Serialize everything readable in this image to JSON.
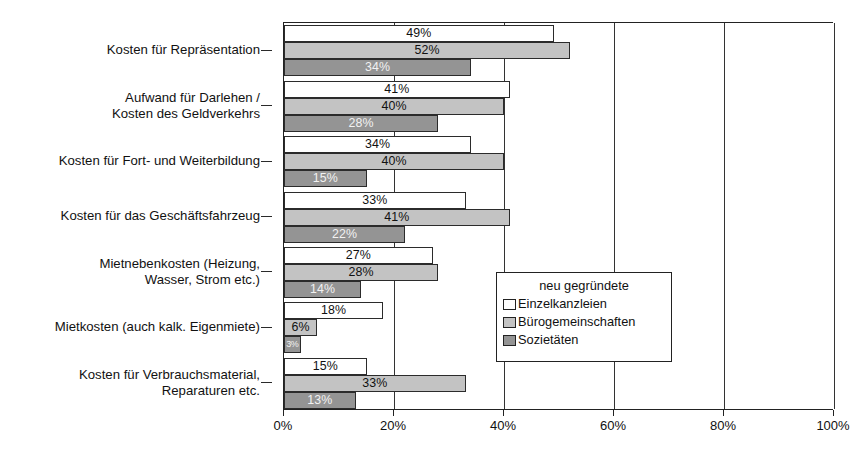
{
  "chart_data": {
    "type": "bar",
    "orientation": "horizontal",
    "title": "",
    "xlabel": "",
    "ylabel": "",
    "xlim": [
      0,
      100
    ],
    "xticks": [
      "0%",
      "20%",
      "40%",
      "60%",
      "80%",
      "100%"
    ],
    "xtick_values": [
      0,
      20,
      40,
      60,
      80,
      100
    ],
    "grid": true,
    "grid_axis": "x",
    "legend_position": "inside-lower-right",
    "legend_title": "neu gegründete",
    "categories": [
      "Kosten für Repräsentation",
      "Aufwand für Darlehen /\nKosten des Geldverkehrs",
      "Kosten für Fort- und Weiterbildung",
      "Kosten für das Geschäftsfahrzeug",
      "Mietnebenkosten (Heizung,\nWasser, Strom etc.)",
      "Mietkosten (auch kalk. Eigenmiete)",
      "Kosten für Verbrauchsmaterial,\nReparaturen etc."
    ],
    "series": [
      {
        "name": "Einzelkanzleien",
        "color": "#ffffff",
        "values": [
          49,
          41,
          34,
          33,
          27,
          18,
          15
        ],
        "labels": [
          "49%",
          "41%",
          "34%",
          "33%",
          "27%",
          "18%",
          "15%"
        ]
      },
      {
        "name": "Bürogemeinschaften",
        "color": "#c3c3c3",
        "values": [
          52,
          40,
          40,
          41,
          28,
          6,
          33
        ],
        "labels": [
          "52%",
          "40%",
          "40%",
          "41%",
          "28%",
          "6%",
          "33%"
        ]
      },
      {
        "name": "Sozietäten",
        "color": "#949494",
        "values": [
          34,
          28,
          15,
          22,
          14,
          3,
          13
        ],
        "labels": [
          "34%",
          "28%",
          "15%",
          "22%",
          "14%",
          "3%",
          "13%"
        ]
      }
    ]
  },
  "legend": {
    "title": "neu gegründete",
    "items": [
      {
        "label": "Einzelkanzleien"
      },
      {
        "label": "Bürogemeinschaften"
      },
      {
        "label": "Sozietäten"
      }
    ]
  },
  "axis": {
    "x_labels": [
      "0%",
      "20%",
      "40%",
      "60%",
      "80%",
      "100%"
    ]
  },
  "colors": {
    "series1": "#ffffff",
    "series2": "#c3c3c3",
    "series3": "#949494",
    "outline": "#222222",
    "text": "#111111",
    "background": "#ffffff"
  }
}
